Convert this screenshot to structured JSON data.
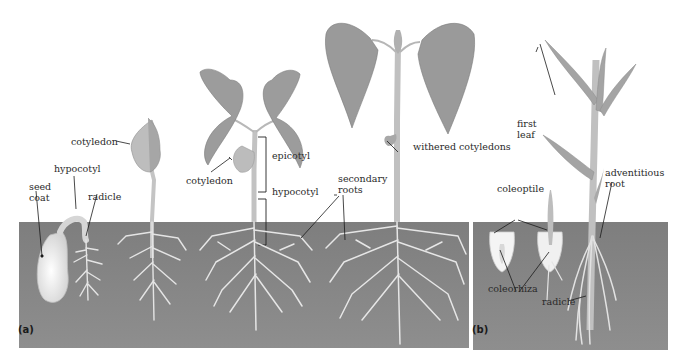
{
  "figure": {
    "panels": [
      {
        "id": "a",
        "label": "(a)",
        "subject": "dicot (bean) seed germination sequence",
        "labels": {
          "seed_coat": "seed\ncoat",
          "hypocotyl_1": "hypocotyl",
          "radicle": "radicle",
          "cotyledon_1": "cotyledon",
          "cotyledon_2": "cotyledon",
          "epicotyl": "epicotyl",
          "hypocotyl_2": "hypocotyl",
          "secondary_roots": "secondary\nroots",
          "withered_cotyledons": "withered cotyledons"
        }
      },
      {
        "id": "b",
        "label": "(b)",
        "subject": "monocot (corn) seed germination sequence",
        "labels": {
          "first_leaf": "first\nleaf",
          "coleoptile": "coleoptile",
          "adventitious_root": "adventitious\nroot",
          "coleorhiza": "coleorhiza",
          "radicle": "radicle"
        }
      }
    ],
    "colors": {
      "soil": "#8a8a8a",
      "soil_dark": "#7a7a7a",
      "plant": "#c8c8c8",
      "leaf": "#9a9a9a",
      "root": "#e6e6e6",
      "leader_line": "#1a1a1a",
      "text": "#2a2a2a"
    }
  }
}
